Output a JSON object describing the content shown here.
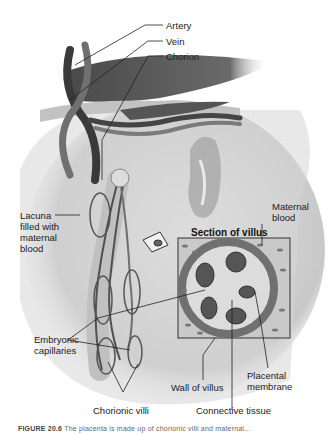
{
  "figure": {
    "title": "Section of villus",
    "labels": {
      "artery": "Artery",
      "vein": "Vein",
      "chorion": "Chorion",
      "lacuna": "Lacuna\nfilled with\nmaternal\nblood",
      "maternal_blood": "Maternal\nblood",
      "embryonic_capillaries": "Embryonic\ncapillaries",
      "chorionic_villi": "Chorionic villi",
      "wall_of_villus": "Wall of villus",
      "placental_membrane": "Placental\nmembrane",
      "connective_tissue": "Connective tissue"
    },
    "caption_prefix": "FIGURE 20.6",
    "caption_text": "The placenta is made up of chorionic villi and maternal..."
  },
  "colors": {
    "background": "#ffffff",
    "tissue_light": "#d8d8d8",
    "tissue_mid": "#9a9a9a",
    "vessel_dark": "#3c3c3c",
    "leader_line": "#222222"
  }
}
